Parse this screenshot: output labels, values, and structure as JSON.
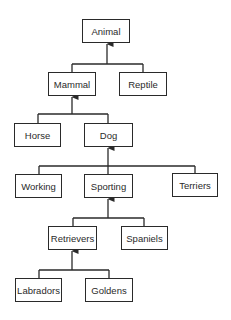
{
  "diagram": {
    "type": "class-hierarchy",
    "nodes": [
      {
        "id": "animal",
        "label": "Animal",
        "x": 82,
        "y": 19,
        "w": 48,
        "h": 24
      },
      {
        "id": "mammal",
        "label": "Mammal",
        "x": 48,
        "y": 72,
        "w": 48,
        "h": 24
      },
      {
        "id": "reptile",
        "label": "Reptile",
        "x": 119,
        "y": 72,
        "w": 48,
        "h": 24
      },
      {
        "id": "horse",
        "label": "Horse",
        "x": 14,
        "y": 123,
        "w": 47,
        "h": 24
      },
      {
        "id": "dog",
        "label": "Dog",
        "x": 84,
        "y": 123,
        "w": 49,
        "h": 24
      },
      {
        "id": "working",
        "label": "Working",
        "x": 15,
        "y": 174,
        "w": 47,
        "h": 24
      },
      {
        "id": "sporting",
        "label": "Sporting",
        "x": 84,
        "y": 174,
        "w": 49,
        "h": 24
      },
      {
        "id": "terriers",
        "label": "Terriers",
        "x": 172,
        "y": 173,
        "w": 46,
        "h": 24
      },
      {
        "id": "retrievers",
        "label": "Retrievers",
        "x": 48,
        "y": 226,
        "w": 49,
        "h": 24
      },
      {
        "id": "spaniels",
        "label": "Spaniels",
        "x": 121,
        "y": 226,
        "w": 47,
        "h": 24
      },
      {
        "id": "labradors",
        "label": "Labradors",
        "x": 15,
        "y": 278,
        "w": 47,
        "h": 24
      },
      {
        "id": "goldens",
        "label": "Goldens",
        "x": 85,
        "y": 278,
        "w": 48,
        "h": 24
      }
    ],
    "edges": [
      {
        "parent": "animal",
        "children": [
          "mammal",
          "reptile"
        ]
      },
      {
        "parent": "mammal",
        "children": [
          "horse",
          "dog"
        ]
      },
      {
        "parent": "dog",
        "children": [
          "working",
          "sporting",
          "terriers"
        ]
      },
      {
        "parent": "sporting",
        "children": [
          "retrievers",
          "spaniels"
        ]
      },
      {
        "parent": "retrievers",
        "children": [
          "labradors",
          "goldens"
        ]
      }
    ],
    "colors": {
      "line": "#2a2a2a",
      "text": "#2a2a2a",
      "background": "#ffffff"
    }
  }
}
